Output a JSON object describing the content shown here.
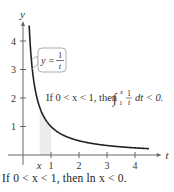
{
  "chart_data": {
    "type": "line",
    "function": "y = 1/t",
    "x": [
      0.22,
      0.25,
      0.3,
      0.4,
      0.5,
      0.6,
      0.8,
      1.0,
      1.5,
      2.0,
      2.5,
      3.0,
      3.5,
      4.0,
      4.5
    ],
    "series": [
      {
        "name": "y = 1/t",
        "values": [
          4.545,
          4.0,
          3.333,
          2.5,
          2.0,
          1.667,
          1.25,
          1.0,
          0.667,
          0.5,
          0.4,
          0.333,
          0.286,
          0.25,
          0.222
        ]
      }
    ],
    "shaded_region": {
      "from": "x",
      "to": 1,
      "x_value": 0.6
    },
    "xlabel": "t",
    "ylabel": "y",
    "xticks": [
      "1",
      "2",
      "3",
      "4"
    ],
    "yticks": [
      "1",
      "2",
      "3",
      "4"
    ],
    "x_marker_label": "x",
    "xlim": [
      0,
      4.7
    ],
    "ylim": [
      0,
      4.6
    ],
    "curve_label": {
      "lhs": "y =",
      "num": "1",
      "den": "t"
    },
    "annotation": {
      "prefix": "If 0 < x < 1, then",
      "upper": "x",
      "lower": "1",
      "num": "1",
      "den": "t",
      "suffix": "dt < 0."
    },
    "grid": false
  },
  "caption": "If 0 < x < 1, then ln x < 0."
}
